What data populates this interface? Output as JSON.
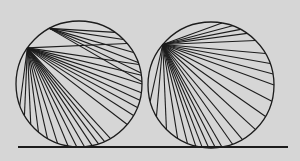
{
  "figure": {
    "background": "#d6d6d6",
    "stroke": "#1c1c1c",
    "ground_line": {
      "x1": 18,
      "y1": 147,
      "x2": 288,
      "y2": 147,
      "width": 2
    },
    "circles": [
      {
        "name": "left-circle",
        "cx": 79,
        "cy": 84,
        "r": 63,
        "fans": [
          {
            "origin_deg": 215,
            "targets_deg": [
              160,
              150,
              140,
              130,
              120,
              110,
              100,
              92,
              85,
              78,
              72,
              66,
              60,
              40,
              30,
              22,
              15,
              8,
              0,
              -8,
              -18,
              -40
            ]
          },
          {
            "origin_deg": 242,
            "targets_deg": [
              -20,
              -10,
              -2,
              -30,
              -45,
              -55
            ]
          }
        ]
      },
      {
        "name": "right-circle",
        "cx": 211,
        "cy": 85,
        "r": 63,
        "fans": [
          {
            "origin_deg": 220,
            "targets_deg": [
              -80,
              -70,
              -62,
              -55,
              -45,
              -30,
              -20,
              -10,
              0,
              15,
              30,
              45,
              60,
              70,
              80,
              86,
              92,
              98,
              104,
              112,
              122,
              135,
              150,
              165
            ]
          }
        ]
      }
    ]
  }
}
